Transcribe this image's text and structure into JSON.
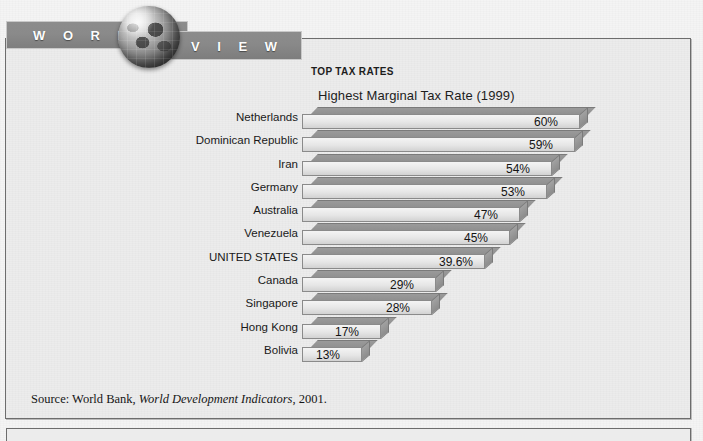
{
  "banner": {
    "word_left": "W O R L D",
    "word_right": "V I E W",
    "globe_icon": "globe-icon"
  },
  "chart_heading": {
    "kicker": "TOP TAX RATES",
    "title": "Highest Marginal Tax Rate (1999)"
  },
  "source": {
    "prefix": "Source: World Bank, ",
    "italic": "World Development Indicators",
    "suffix": ", 2001."
  },
  "colors": {
    "banner_bar": "#8a8a8a",
    "bar_front": "#e6e6e6",
    "bar_top": "#949494",
    "bar_side": "#959595",
    "panel_bg": "#ececec",
    "border": "#6d6d6d",
    "text": "#191919"
  },
  "chart_data": {
    "type": "bar",
    "orientation": "horizontal",
    "style": "3d",
    "title": "Highest Marginal Tax Rate (1999)",
    "subtitle": "TOP TAX RATES",
    "xlabel": "",
    "ylabel": "",
    "xlim": [
      0,
      60
    ],
    "grid": false,
    "legend": false,
    "categories": [
      "Netherlands",
      "Dominican Republic",
      "Iran",
      "Germany",
      "Australia",
      "Venezuela",
      "UNITED STATES",
      "Canada",
      "Singapore",
      "Hong Kong",
      "Bolivia"
    ],
    "values": [
      60,
      59,
      54,
      53,
      47,
      45,
      39.6,
      29,
      28,
      17,
      13
    ],
    "value_labels": [
      "60%",
      "59%",
      "54%",
      "53%",
      "47%",
      "45%",
      "39.6%",
      "29%",
      "28%",
      "17%",
      "13%"
    ],
    "source": "Source: World Bank, World Development Indicators, 2001."
  }
}
